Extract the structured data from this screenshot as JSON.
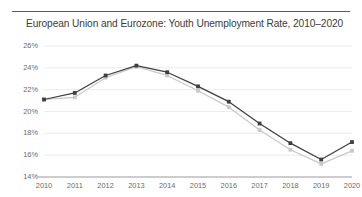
{
  "header": {
    "title": "European Union and Eurozone: Youth Unemployment Rate, 2010–2020"
  },
  "axis": {
    "y_ticks": [
      "26%",
      "24%",
      "22%",
      "20%",
      "18%",
      "16%",
      "14%"
    ],
    "x_ticks": [
      "2010",
      "2011",
      "2012",
      "2013",
      "2014",
      "2015",
      "2016",
      "2017",
      "2018",
      "2019",
      "2020"
    ]
  },
  "colors": {
    "series_eu": "#3f3f3f",
    "series_ea": "#c9c9c9",
    "grid": "#ececec",
    "axis": "#9a9a9a",
    "title_text": "#3c3c3c",
    "tick_text": "#6b6b6b",
    "rule": "#5a5a5a",
    "background": "#ffffff"
  },
  "chart_data": {
    "type": "line",
    "title": "European Union and Eurozone: Youth Unemployment Rate, 2010–2020",
    "xlabel": "",
    "ylabel": "",
    "x": [
      2010,
      2011,
      2012,
      2013,
      2014,
      2015,
      2016,
      2017,
      2018,
      2019,
      2020
    ],
    "categories": [
      "2010",
      "2011",
      "2012",
      "2013",
      "2014",
      "2015",
      "2016",
      "2017",
      "2018",
      "2019",
      "2020"
    ],
    "ylim": [
      14,
      26
    ],
    "ytick_values": [
      26,
      24,
      22,
      20,
      18,
      16,
      14
    ],
    "grid": true,
    "legend": "none",
    "series": [
      {
        "name": "European Union",
        "color": "#3f3f3f",
        "marker": "square",
        "values": [
          21.1,
          21.7,
          23.3,
          24.2,
          23.6,
          22.3,
          20.9,
          18.9,
          17.1,
          15.6,
          17.2
        ]
      },
      {
        "name": "Eurozone",
        "color": "#c9c9c9",
        "marker": "square",
        "values": [
          21.1,
          21.3,
          23.1,
          24.1,
          23.3,
          21.9,
          20.4,
          18.3,
          16.5,
          15.2,
          16.4
        ]
      }
    ]
  }
}
